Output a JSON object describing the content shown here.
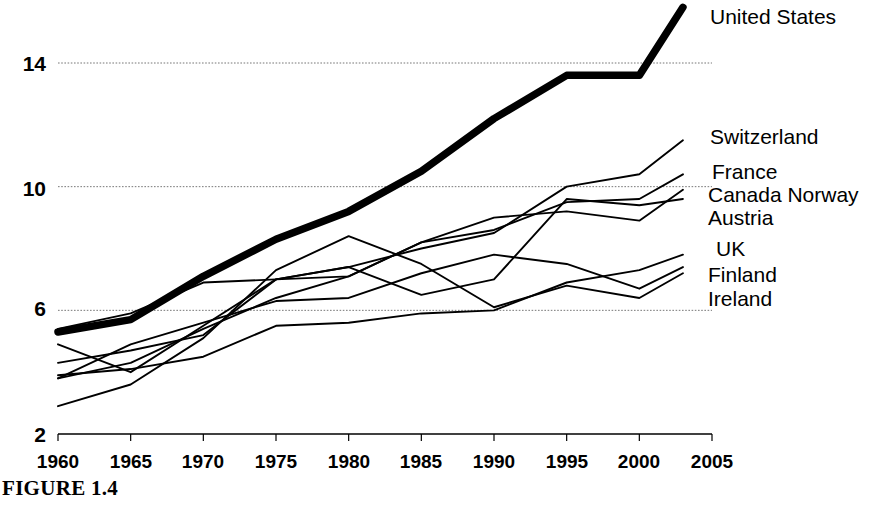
{
  "figure": {
    "caption": "FIGURE 1.4"
  },
  "chart_data": {
    "type": "line",
    "title": "",
    "xlabel": "",
    "ylabel": "",
    "xlim": [
      1960,
      2005
    ],
    "ylim": [
      2,
      16.5
    ],
    "x_ticks": [
      1960,
      1965,
      1970,
      1975,
      1980,
      1985,
      1990,
      1995,
      2000,
      2005
    ],
    "y_ticks": [
      2,
      6,
      10,
      14
    ],
    "gridlines": {
      "y": [
        6,
        10,
        14
      ],
      "style": "dotted",
      "x": false
    },
    "legend_position": "right-inline-labels",
    "series": [
      {
        "name": "United States",
        "emphasis": "bold",
        "label_y": 18,
        "x": [
          1960,
          1965,
          1970,
          1975,
          1980,
          1985,
          1990,
          1995,
          2000,
          2003
        ],
        "values": [
          5.3,
          5.7,
          7.1,
          8.3,
          9.2,
          10.5,
          12.2,
          13.6,
          13.6,
          15.8
        ]
      },
      {
        "name": "Switzerland",
        "emphasis": "thin",
        "label_y": 127,
        "x": [
          1960,
          1965,
          1970,
          1975,
          1980,
          1985,
          1990,
          1995,
          2000,
          2003
        ],
        "values": [
          4.9,
          4.0,
          5.5,
          7.0,
          7.4,
          8.0,
          8.5,
          10.0,
          10.4,
          11.5
        ]
      },
      {
        "name": "France",
        "emphasis": "thin",
        "label_y": 162,
        "x": [
          1960,
          1965,
          1970,
          1975,
          1980,
          1985,
          1990,
          1995,
          2000,
          2003
        ],
        "values": [
          3.8,
          4.3,
          5.4,
          6.4,
          7.1,
          8.2,
          8.6,
          9.5,
          9.6,
          10.4
        ]
      },
      {
        "name": "Canada  Norway",
        "emphasis": "thin",
        "label_y": 186,
        "x": [
          1960,
          1965,
          1970,
          1975,
          1980,
          1985,
          1990,
          1995,
          2000,
          2003
        ],
        "values": [
          5.4,
          5.9,
          6.9,
          7.0,
          7.1,
          8.2,
          9.0,
          9.2,
          8.9,
          9.9
        ]
      },
      {
        "name": "Austria",
        "emphasis": "thin",
        "label_y": 209,
        "x": [
          1960,
          1965,
          1970,
          1975,
          1980,
          1985,
          1990,
          1995,
          2000,
          2003
        ],
        "values": [
          4.3,
          4.7,
          5.2,
          7.0,
          7.4,
          6.5,
          7.0,
          9.6,
          9.4,
          9.6
        ]
      },
      {
        "name": "UK",
        "emphasis": "thin",
        "label_y": 240,
        "x": [
          1960,
          1965,
          1970,
          1975,
          1980,
          1985,
          1990,
          1995,
          2000,
          2003
        ],
        "values": [
          3.9,
          4.1,
          4.5,
          5.5,
          5.6,
          5.9,
          6.0,
          6.9,
          7.3,
          7.8
        ]
      },
      {
        "name": "Finland",
        "emphasis": "thin",
        "label_y": 266,
        "x": [
          1960,
          1965,
          1970,
          1975,
          1980,
          1985,
          1990,
          1995,
          2000,
          2003
        ],
        "values": [
          3.8,
          4.9,
          5.6,
          6.3,
          6.4,
          7.2,
          7.8,
          7.5,
          6.7,
          7.4
        ]
      },
      {
        "name": "Ireland",
        "emphasis": "thin",
        "label_y": 290,
        "x": [
          1960,
          1965,
          1970,
          1975,
          1980,
          1985,
          1990,
          1995,
          2000,
          2003
        ],
        "values": [
          2.9,
          3.6,
          5.1,
          7.3,
          8.4,
          7.5,
          6.1,
          6.8,
          6.4,
          7.2
        ]
      }
    ]
  },
  "axis": {
    "x_tick_labels": [
      "1960",
      "1965",
      "1970",
      "1975",
      "1980",
      "1985",
      "1990",
      "1995",
      "2000",
      "2005"
    ],
    "y_tick_labels": [
      "14",
      "10",
      "6",
      "2"
    ]
  },
  "colors": {
    "line": "#000000",
    "grid": "#777777",
    "axis": "#000000",
    "background": "#ffffff"
  }
}
